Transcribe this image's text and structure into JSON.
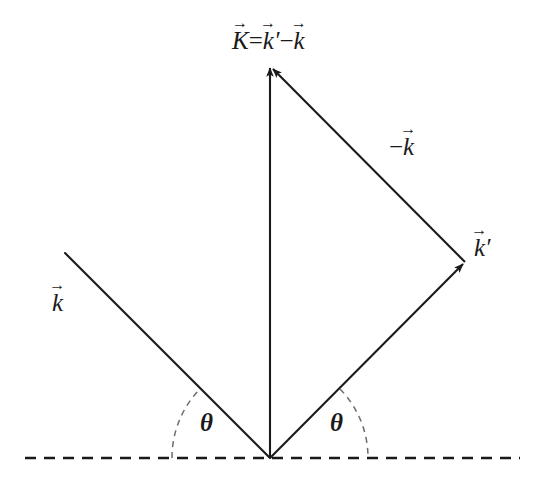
{
  "diagram": {
    "name": "scattering-vector-diagram",
    "background_color": "#ffffff",
    "stroke_color": "#1a1a1a",
    "labels": {
      "scattering_vector": {
        "K": "K",
        "equals": "=",
        "k_prime": "k",
        "prime_mark": "′",
        "minus": "−",
        "k": "k",
        "full_text": "K⃗ = k⃗′ − k⃗"
      },
      "incident": {
        "symbol": "k",
        "full_text": "k⃗"
      },
      "scattered": {
        "symbol": "k",
        "prime_mark": "′",
        "full_text": "k⃗′"
      },
      "negative_incident": {
        "minus": "−",
        "symbol": "k",
        "full_text": "−k⃗"
      },
      "angle_left": "θ",
      "angle_right": "θ",
      "vector_accent": "→"
    },
    "geometry": {
      "vertex": {
        "x": 270,
        "y": 458
      },
      "apex": {
        "x": 270,
        "y": 65
      },
      "right_vertex": {
        "x": 465,
        "y": 262
      },
      "incident_start": {
        "x": 65,
        "y": 253
      },
      "baseline": {
        "x1": 25,
        "x2": 520,
        "y": 458
      },
      "angle_left_degrees": 45,
      "angle_right_degrees": 45,
      "arc_radius_left": 98,
      "arc_radius_right": 98
    }
  }
}
